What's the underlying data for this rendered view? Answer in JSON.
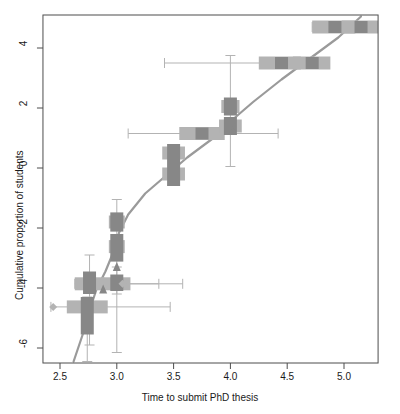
{
  "chart_data": {
    "type": "scatter",
    "title": "",
    "subtitle": "",
    "xlabel": "Time to submit PhD thesis",
    "ylabel": "Cumulative proportion of students",
    "xlim": [
      2.35,
      5.3
    ],
    "ylim": [
      -6.5,
      5.1
    ],
    "xticks": [
      2.5,
      3.0,
      3.5,
      4.0,
      4.5,
      5.0
    ],
    "xtick_labels": [
      "2.5",
      "3.0",
      "3.5",
      "4.0",
      "4.5",
      "5.0"
    ],
    "yticks": [
      4,
      2,
      0,
      -2,
      -4,
      -6
    ],
    "ytick_labels": [
      "4",
      "2",
      "0",
      "-2",
      "-4",
      "-6"
    ],
    "grid": false,
    "legend": "none",
    "colors": {
      "x_box": "#b3b3b3",
      "y_box": "#878787",
      "whisker": "#b3b3b3",
      "fit_line": "#9a9a9a",
      "axis": "#4d4d4d",
      "text": "#1a1a1a"
    },
    "points": [
      {
        "x": 2.74,
        "y": -4.63,
        "x_q1": 2.56,
        "x_q3": 2.92,
        "x_lo": 2.42,
        "x_hi": 3.47,
        "y_q1": -5.55,
        "y_q3": -4.3,
        "y_lo": -6.45,
        "y_hi": -4.3
      },
      {
        "x": 2.76,
        "y": -3.86,
        "x_q1": 2.63,
        "x_q3": 2.89,
        "x_lo": 2.63,
        "x_hi": 3.37,
        "y_q1": -4.2,
        "y_q3": -3.45,
        "y_lo": -5.9,
        "y_hi": -2.9
      },
      {
        "x": 3.0,
        "y": -3.86,
        "x_q1": 2.86,
        "x_q3": 3.12,
        "x_lo": 2.86,
        "x_hi": 3.58,
        "y_q1": -4.1,
        "y_q3": -3.55,
        "y_lo": -4.2,
        "y_hi": -3.3
      },
      {
        "x": 3.0,
        "y": -2.62,
        "x_q1": 2.93,
        "x_q3": 3.07,
        "x_lo": 2.93,
        "x_hi": 3.07,
        "y_q1": -3.12,
        "y_q3": -2.2,
        "y_lo": -6.15,
        "y_hi": -1.05
      },
      {
        "x": 3.0,
        "y": -1.8,
        "x_q1": 2.93,
        "x_q3": 3.07,
        "x_lo": 2.93,
        "x_hi": 3.07,
        "y_q1": -2.12,
        "y_q3": -1.48,
        "y_lo": -2.12,
        "y_hi": -1.48
      },
      {
        "x": 3.5,
        "y": -0.2,
        "x_q1": 3.4,
        "x_q3": 3.6,
        "x_lo": 3.4,
        "x_hi": 3.6,
        "y_q1": -0.6,
        "y_q3": 0.2,
        "y_lo": -0.6,
        "y_hi": 0.2
      },
      {
        "x": 3.5,
        "y": 0.5,
        "x_q1": 3.4,
        "x_q3": 3.6,
        "x_lo": 3.4,
        "x_hi": 3.6,
        "y_q1": 0.2,
        "y_q3": 0.8,
        "y_lo": 0.2,
        "y_hi": 0.8
      },
      {
        "x": 3.75,
        "y": 1.15,
        "x_q1": 3.55,
        "x_q3": 3.95,
        "x_lo": 3.1,
        "x_hi": 4.42,
        "y_q1": 0.95,
        "y_q3": 1.35,
        "y_lo": 0.95,
        "y_hi": 1.35
      },
      {
        "x": 4.0,
        "y": 1.4,
        "x_q1": 3.9,
        "x_q3": 4.1,
        "x_lo": 3.9,
        "x_hi": 4.1,
        "y_q1": 1.1,
        "y_q3": 1.7,
        "y_lo": 0.05,
        "y_hi": 3.75
      },
      {
        "x": 4.0,
        "y": 2.05,
        "x_q1": 3.92,
        "x_q3": 4.08,
        "x_lo": 3.92,
        "x_hi": 4.08,
        "y_q1": 1.75,
        "y_q3": 2.35,
        "y_lo": 1.75,
        "y_hi": 2.35
      },
      {
        "x": 4.45,
        "y": 3.5,
        "x_q1": 4.25,
        "x_q3": 4.62,
        "x_lo": 3.42,
        "x_hi": 4.62,
        "y_q1": 3.3,
        "y_q3": 3.7,
        "y_lo": 3.3,
        "y_hi": 3.7
      },
      {
        "x": 4.72,
        "y": 3.5,
        "x_q1": 4.55,
        "x_q3": 4.88,
        "x_lo": 4.55,
        "x_hi": 4.88,
        "y_q1": 3.3,
        "y_q3": 3.7,
        "y_lo": 3.3,
        "y_hi": 3.7
      },
      {
        "x": 4.92,
        "y": 4.7,
        "x_q1": 4.72,
        "x_q3": 5.1,
        "x_lo": 4.72,
        "x_hi": 5.28,
        "y_q1": 4.5,
        "y_q3": 4.9,
        "y_lo": 4.5,
        "y_hi": 4.9
      },
      {
        "x": 5.15,
        "y": 4.7,
        "x_q1": 4.98,
        "x_q3": 5.3,
        "x_lo": 4.98,
        "x_hi": 5.3,
        "y_q1": 4.5,
        "y_q3": 4.9,
        "y_lo": 4.5,
        "y_hi": 4.9
      }
    ],
    "fit_line": [
      {
        "x": 2.62,
        "y": -6.45
      },
      {
        "x": 2.7,
        "y": -5.55
      },
      {
        "x": 2.76,
        "y": -4.75
      },
      {
        "x": 2.82,
        "y": -4.05
      },
      {
        "x": 2.9,
        "y": -3.45
      },
      {
        "x": 2.97,
        "y": -2.8
      },
      {
        "x": 3.02,
        "y": -2.15
      },
      {
        "x": 3.1,
        "y": -1.55
      },
      {
        "x": 3.25,
        "y": -0.85
      },
      {
        "x": 3.45,
        "y": -0.2
      },
      {
        "x": 3.62,
        "y": 0.35
      },
      {
        "x": 3.85,
        "y": 1.0
      },
      {
        "x": 4.0,
        "y": 1.55
      },
      {
        "x": 4.2,
        "y": 2.2
      },
      {
        "x": 4.45,
        "y": 2.95
      },
      {
        "x": 4.7,
        "y": 3.65
      },
      {
        "x": 4.95,
        "y": 4.35
      },
      {
        "x": 5.15,
        "y": 5.05
      }
    ],
    "markers": [
      {
        "x": 2.44,
        "y": -4.63,
        "shape": "diamond"
      },
      {
        "x": 3.05,
        "y": -3.86,
        "shape": "diamond"
      },
      {
        "x": 3.0,
        "y": -3.3,
        "shape": "triangle-up"
      },
      {
        "x": 2.88,
        "y": -4.05,
        "shape": "triangle-up"
      },
      {
        "x": 4.02,
        "y": 1.25,
        "shape": "triangle-up"
      }
    ]
  },
  "axes": {
    "x_title": "Time to submit PhD thesis",
    "y_title": "Cumulative proportion of students"
  }
}
